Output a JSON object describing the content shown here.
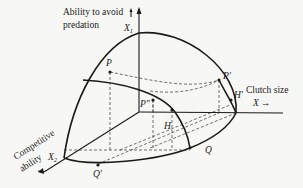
{
  "axes": {
    "x1": {
      "symbol": "X",
      "subscript": "1",
      "label_line1": "Ability to avoid",
      "label_line2": "predation"
    },
    "x2": {
      "symbol": "X",
      "subscript": "2",
      "label_line1": "Competitive",
      "label_line2": "ability"
    },
    "x": {
      "symbol": "X",
      "label": "Clutch size",
      "arrow": "→"
    }
  },
  "points": {
    "p": "P",
    "p_prime": "P′",
    "p_double_prime": "P″",
    "h": "H",
    "h_prime": "H′",
    "q": "Q",
    "q_prime": "Q′"
  }
}
